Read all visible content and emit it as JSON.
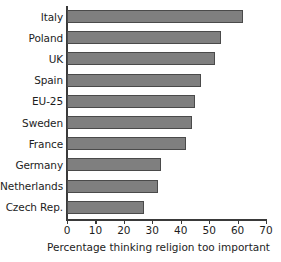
{
  "chart_data": {
    "type": "bar",
    "orientation": "horizontal",
    "title": "",
    "xlabel": "Percentage thinking religion too important",
    "ylabel": "",
    "categories": [
      "Italy",
      "Poland",
      "UK",
      "Spain",
      "EU-25",
      "Sweden",
      "France",
      "Germany",
      "Netherlands",
      "Czech Rep."
    ],
    "values": [
      62,
      54,
      52,
      47,
      45,
      44,
      42,
      33,
      32,
      27
    ],
    "xlim": [
      0,
      70
    ],
    "xticks": [
      0,
      10,
      20,
      30,
      40,
      50,
      60,
      70
    ],
    "xticklabels": [
      "0",
      "10",
      "20",
      "30",
      "40",
      "50",
      "60",
      "70"
    ],
    "grid": false,
    "legend": false,
    "bar_fill_color": "#7f7f7f",
    "bar_edge_color": "#4a4a4a",
    "axis_color": "#3a3a3a",
    "background_color": "#ffffff"
  }
}
